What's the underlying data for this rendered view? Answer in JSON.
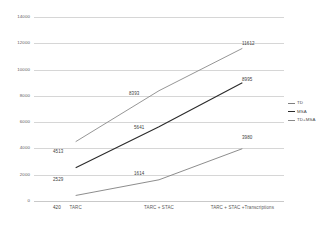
{
  "chart_data": {
    "type": "line",
    "title": "",
    "xlabel": "",
    "ylabel": "",
    "ylim": [
      0,
      14000
    ],
    "grid": true,
    "legend_position": "right",
    "categories": [
      "TARC",
      "TARC + STAC",
      "TARC + STAC +Transcriptions"
    ],
    "y_ticks": [
      "0",
      "2000",
      "4000",
      "6000",
      "8000",
      "10000",
      "12000",
      "14000"
    ],
    "y_tick_values": [
      0,
      2000,
      4000,
      6000,
      8000,
      10000,
      12000,
      14000
    ],
    "series": [
      {
        "name": "TD",
        "color": "#808080",
        "values": [
          420,
          1614,
          3980
        ],
        "labels": [
          "420",
          "1614",
          "3980"
        ]
      },
      {
        "name": "MSA",
        "color": "#2b2b2b",
        "values": [
          2529,
          5641,
          8995
        ],
        "labels": [
          "2529",
          "5641",
          "8995"
        ]
      },
      {
        "name": "TD+MSA",
        "color": "#8a8a8a",
        "values": [
          4513,
          8393,
          11612
        ],
        "labels": [
          "4513",
          "8393",
          "11612"
        ]
      }
    ]
  },
  "legend": {
    "items": [
      {
        "label": "TD"
      },
      {
        "label": "MSA"
      },
      {
        "label": "TD+MSA"
      }
    ]
  }
}
